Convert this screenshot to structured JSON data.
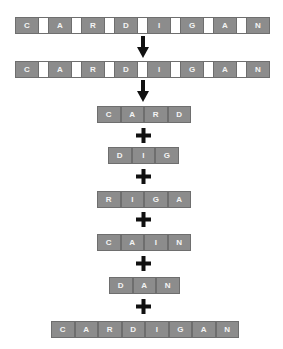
{
  "word_with_gaps_1": [
    "C",
    "A",
    "R",
    "D",
    "I",
    "G",
    "A",
    "N"
  ],
  "word_with_gaps_2": [
    "C",
    "A",
    "R",
    "D",
    "I",
    "G",
    "A",
    "N"
  ],
  "parts": [
    {
      "name": "card",
      "letters": [
        "C",
        "A",
        "R",
        "D"
      ]
    },
    {
      "name": "dig",
      "letters": [
        "D",
        "I",
        "G"
      ]
    },
    {
      "name": "riga",
      "letters": [
        "R",
        "I",
        "G",
        "A"
      ]
    },
    {
      "name": "cain",
      "letters": [
        "C",
        "A",
        "I",
        "N"
      ]
    },
    {
      "name": "dan",
      "letters": [
        "D",
        "A",
        "N"
      ]
    }
  ],
  "result": [
    "C",
    "A",
    "R",
    "D",
    "I",
    "G",
    "A",
    "N"
  ],
  "icons": {
    "arrow": "down-arrow-icon",
    "plus": "plus-icon"
  },
  "colors": {
    "cell": "#8c8c8c",
    "border": "#6e6e6e",
    "letter": "#f4f4f4",
    "symbol": "#111111"
  }
}
